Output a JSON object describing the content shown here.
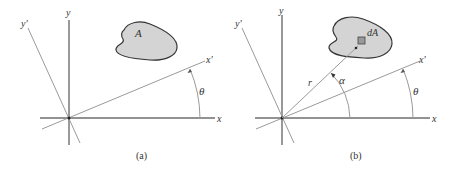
{
  "figure": {
    "panels": [
      {
        "caption": "(a)",
        "labels": {
          "x": "x",
          "y": "y",
          "x_prime": "x'",
          "y_prime": "y'",
          "theta": "θ",
          "area": "A"
        }
      },
      {
        "caption": "(b)",
        "labels": {
          "x": "x",
          "y": "y",
          "x_prime": "x'",
          "y_prime": "y'",
          "theta": "θ",
          "alpha": "α",
          "r": "r",
          "area_element": "dA"
        }
      }
    ],
    "colors": {
      "axis": "#6e6e6e",
      "rotated_axis": "#9a9a9a",
      "area_fill": "#d4d4d4",
      "area_stroke": "#333333",
      "text": "#333333"
    }
  }
}
